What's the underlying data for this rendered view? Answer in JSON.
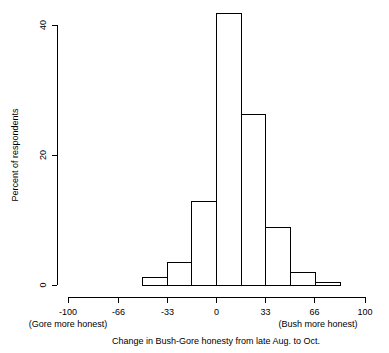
{
  "chart_data": {
    "type": "bar",
    "title": "",
    "subtitle": "",
    "xlabel": "Change in Bush-Gore honesty from late Aug. to Oct.",
    "ylabel": "Percent of respondents",
    "xlim": [
      -100,
      100
    ],
    "ylim": [
      0,
      43
    ],
    "grid": false,
    "legend": null,
    "x_tick_labels": [
      "-100",
      "-66",
      "-33",
      "0",
      "33",
      "66",
      "100"
    ],
    "x_tick_values": [
      -100,
      -66,
      -33,
      0,
      33,
      66,
      100
    ],
    "y_tick_labels": [
      "0",
      "20",
      "40"
    ],
    "y_tick_values": [
      0,
      20,
      40
    ],
    "annotations": [
      {
        "name": "left-annotation",
        "text": "(Gore more honest)",
        "x": -100
      },
      {
        "name": "right-annotation",
        "text": "(Bush more honest)",
        "x": 66
      }
    ],
    "bin_edges": [
      -50,
      -33.3,
      -16.7,
      0,
      16.7,
      33.3,
      50,
      66.7,
      83.3
    ],
    "bins": [
      {
        "x0": -50,
        "x1": -33.3,
        "value": 1.2
      },
      {
        "x0": -33.3,
        "x1": -16.7,
        "value": 3.5
      },
      {
        "x0": -16.7,
        "x1": 0,
        "value": 12.8
      },
      {
        "x0": 0,
        "x1": 16.7,
        "value": 41.7
      },
      {
        "x0": 16.7,
        "x1": 33.3,
        "value": 26.3
      },
      {
        "x0": 33.3,
        "x1": 50,
        "value": 8.9
      },
      {
        "x0": 50,
        "x1": 66.7,
        "value": 2.0
      },
      {
        "x0": 66.7,
        "x1": 83.3,
        "value": 0.4
      }
    ],
    "values": [
      1.2,
      3.5,
      12.8,
      41.7,
      26.3,
      8.9,
      2.0,
      0.4
    ],
    "categories": [
      "-50 to -33",
      "-33 to -17",
      "-17 to 0",
      "0 to 17",
      "17 to 33",
      "33 to 50",
      "50 to 67",
      "67 to 83"
    ],
    "colors": {
      "bar_fill": "#ffffff",
      "bar_stroke": "#000000",
      "axis": "#000000",
      "background": "#ffffff"
    }
  }
}
